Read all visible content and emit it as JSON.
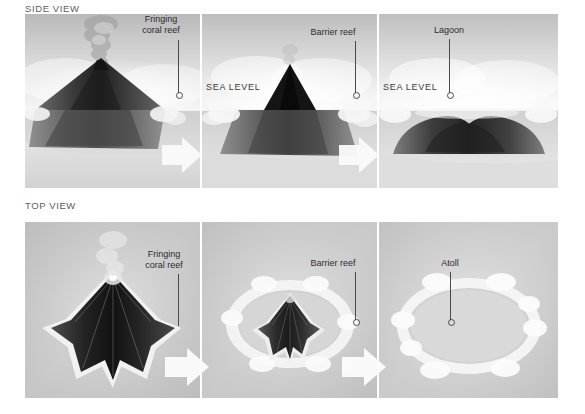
{
  "diagram": {
    "rows": [
      {
        "id": "side-view",
        "label": "SIDE VIEW",
        "panels": [
          {
            "id": "side-stage-1",
            "stage": 1,
            "annotation": "Fringing\ncoral reef",
            "annotation_line1": "Fringing",
            "annotation_line2": "coral reef",
            "sea_level_label": "",
            "scene": "erupting volcanic island with fringing reef at shoreline"
          },
          {
            "id": "side-stage-2",
            "stage": 2,
            "annotation_line1": "Barrier reef",
            "annotation_line2": "",
            "sea_level_label": "SEA LEVEL",
            "scene": "subsiding volcano with barrier reef and lagoon"
          },
          {
            "id": "side-stage-3",
            "stage": 3,
            "annotation_line1": "Lagoon",
            "annotation_line2": "",
            "sea_level_label": "SEA LEVEL",
            "scene": "fully submerged volcano forming atoll with lagoon"
          }
        ]
      },
      {
        "id": "top-view",
        "label": "TOP VIEW",
        "panels": [
          {
            "id": "top-stage-1",
            "stage": 1,
            "annotation_line1": "Fringing",
            "annotation_line2": "coral reef",
            "scene": "volcanic island seen from above with fringing reef outline"
          },
          {
            "id": "top-stage-2",
            "stage": 2,
            "annotation_line1": "Barrier reef",
            "annotation_line2": "",
            "scene": "shrinking island encircled by barrier reef ring"
          },
          {
            "id": "top-stage-3",
            "stage": 3,
            "annotation_line1": "Atoll",
            "annotation_line2": "",
            "scene": "ring-shaped atoll with central lagoon"
          }
        ]
      }
    ],
    "arrows": [
      {
        "id": "side-arrow-1",
        "direction": "right"
      },
      {
        "id": "side-arrow-2",
        "direction": "right"
      },
      {
        "id": "top-arrow-1",
        "direction": "right"
      },
      {
        "id": "top-arrow-2",
        "direction": "right"
      }
    ],
    "colors": {
      "background": "#ffffff",
      "sky_light": "#f2f2f2",
      "sky_mid": "#c9c9c9",
      "water": "#d4d4d4",
      "rock_dark": "#2a2a2a",
      "rock_mid": "#6b6b6b",
      "reef_white": "#fbfbfb",
      "text": "#2b2b2b",
      "label_gray": "#5c5c5c",
      "arrow": "#fdfdfd"
    }
  }
}
